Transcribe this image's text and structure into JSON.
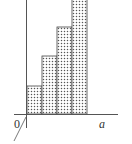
{
  "diagram": {
    "type": "step-histogram",
    "origin_label": "0",
    "x_axis_label": "a",
    "fill_pattern": "dotted",
    "colors": {
      "axis": "#555555",
      "outline": "#444444",
      "dot": "#555555",
      "background": "#ffffff"
    },
    "bars": [
      {
        "index": 1,
        "relative_height": 1
      },
      {
        "index": 2,
        "relative_height": 2
      },
      {
        "index": 3,
        "relative_height": 3
      },
      {
        "index": 4,
        "relative_height": 4
      }
    ]
  }
}
